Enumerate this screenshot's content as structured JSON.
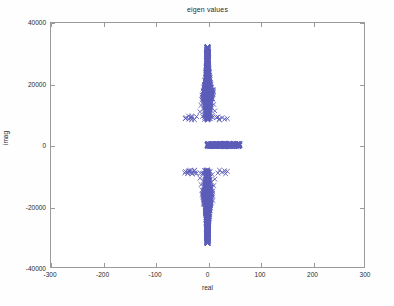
{
  "chart_data": {
    "type": "scatter",
    "title": "eigen values",
    "xlabel": "real",
    "ylabel": "imag",
    "xlim": [
      -300,
      300
    ],
    "ylim": [
      -40000,
      40000
    ],
    "xticks": [
      -300,
      -200,
      -100,
      0,
      100,
      200,
      300
    ],
    "yticks": [
      -40000,
      -20000,
      0,
      20000,
      40000
    ],
    "xticklabels": [
      "-300",
      "-200",
      "-100",
      "0",
      "100",
      "200",
      "300"
    ],
    "yticklabels": [
      "-40000",
      "-20000",
      "0",
      "20000",
      "40000"
    ],
    "grid": false,
    "legend": null,
    "marker": "x",
    "marker_color": "#5b5bb8",
    "axes_color": "#9a9a9a",
    "background_color": "#ffffff",
    "series": [
      {
        "name": "eigenvalues",
        "description": "Complex eigenvalue spectrum: two dense conjugate vertical plumes near real=0 spanning imag from about +/-8000 to +/-32500, plus a dense band of purely real eigenvalues from real=0 to about real=62 at imag=0, plus scattered outliers near imag=+/-9000 spread over real=-42 to +40.",
        "points": [
          [
            0.4,
            31800
          ],
          [
            -0.6,
            31100
          ],
          [
            1.1,
            30500
          ],
          [
            -1.4,
            29800
          ],
          [
            0.9,
            29200
          ],
          [
            -0.3,
            28600
          ],
          [
            1.8,
            28000
          ],
          [
            -1.9,
            27500
          ],
          [
            0.2,
            26900
          ],
          [
            2.3,
            26300
          ],
          [
            -2.5,
            25800
          ],
          [
            1.0,
            25200
          ],
          [
            -0.8,
            24700
          ],
          [
            3.1,
            24100
          ],
          [
            -3.0,
            23600
          ],
          [
            0.5,
            23000
          ],
          [
            2.2,
            22500
          ],
          [
            -2.8,
            21900
          ],
          [
            4.0,
            21400
          ],
          [
            -4.2,
            20800
          ],
          [
            1.3,
            20300
          ],
          [
            -1.1,
            19800
          ],
          [
            5.0,
            19300
          ],
          [
            -5.3,
            18800
          ],
          [
            0.7,
            18300
          ],
          [
            6.5,
            17900
          ],
          [
            -6.8,
            17500
          ],
          [
            2.0,
            17100
          ],
          [
            -2.2,
            16700
          ],
          [
            8.0,
            16300
          ],
          [
            -8.4,
            16000
          ],
          [
            3.5,
            15700
          ],
          [
            -3.7,
            15400
          ],
          [
            10.0,
            15100
          ],
          [
            -10.5,
            14800
          ],
          [
            1.5,
            14500
          ],
          [
            -1.7,
            14200
          ],
          [
            6.0,
            13900
          ],
          [
            -6.3,
            13600
          ],
          [
            12.0,
            13300
          ],
          [
            -12.4,
            13000
          ],
          [
            2.8,
            12700
          ],
          [
            -3.1,
            12400
          ],
          [
            7.5,
            12100
          ],
          [
            -7.9,
            11800
          ],
          [
            0.9,
            11500
          ],
          [
            14.0,
            11200
          ],
          [
            -14.5,
            10900
          ],
          [
            4.5,
            10600
          ],
          [
            -4.8,
            10300
          ],
          [
            1.2,
            10000
          ],
          [
            9.0,
            9700
          ],
          [
            -9.5,
            9400
          ],
          [
            -21.0,
            9300
          ],
          [
            20.0,
            9200
          ],
          [
            -30.0,
            9000
          ],
          [
            28.0,
            8950
          ],
          [
            -42.0,
            8700
          ],
          [
            38.0,
            8650
          ],
          [
            -36.0,
            8500
          ],
          [
            33.0,
            8450
          ],
          [
            -25.0,
            8300
          ],
          [
            23.0,
            8250
          ],
          [
            2.0,
            9000
          ],
          [
            -2.4,
            8800
          ],
          [
            5.5,
            8600
          ],
          [
            -5.9,
            8400
          ],
          [
            0.3,
            8200
          ],
          [
            0.0,
            0
          ],
          [
            3.0,
            0
          ],
          [
            6.0,
            0
          ],
          [
            9.0,
            0
          ],
          [
            12.0,
            0
          ],
          [
            15.0,
            0
          ],
          [
            18.0,
            0
          ],
          [
            21.0,
            0
          ],
          [
            24.0,
            0
          ],
          [
            27.0,
            0
          ],
          [
            30.0,
            0
          ],
          [
            33.0,
            0
          ],
          [
            36.0,
            0
          ],
          [
            39.0,
            0
          ],
          [
            42.0,
            0
          ],
          [
            45.0,
            0
          ],
          [
            48.0,
            0
          ],
          [
            51.0,
            0
          ],
          [
            54.0,
            0
          ],
          [
            57.0,
            0
          ],
          [
            60.0,
            0
          ],
          [
            62.0,
            0
          ],
          [
            -1.0,
            0
          ],
          [
            0.4,
            -31800
          ],
          [
            -0.6,
            -31100
          ],
          [
            1.1,
            -30500
          ],
          [
            -1.4,
            -29800
          ],
          [
            0.9,
            -29200
          ],
          [
            -0.3,
            -28600
          ],
          [
            1.8,
            -28000
          ],
          [
            -1.9,
            -27500
          ],
          [
            0.2,
            -26900
          ],
          [
            2.3,
            -26300
          ],
          [
            -2.5,
            -25800
          ],
          [
            1.0,
            -25200
          ],
          [
            -0.8,
            -24700
          ],
          [
            3.1,
            -24100
          ],
          [
            -3.0,
            -23600
          ],
          [
            0.5,
            -23000
          ],
          [
            2.2,
            -22500
          ],
          [
            -2.8,
            -21900
          ],
          [
            4.0,
            -21400
          ],
          [
            -4.2,
            -20800
          ],
          [
            1.3,
            -20300
          ],
          [
            -1.1,
            -19800
          ],
          [
            5.0,
            -19300
          ],
          [
            -5.3,
            -18800
          ],
          [
            0.7,
            -18300
          ],
          [
            6.5,
            -17900
          ],
          [
            -6.8,
            -17500
          ],
          [
            2.0,
            -17100
          ],
          [
            -2.2,
            -16700
          ],
          [
            8.0,
            -16300
          ],
          [
            -8.4,
            -16000
          ],
          [
            3.5,
            -15700
          ],
          [
            -3.7,
            -15400
          ],
          [
            10.0,
            -15100
          ],
          [
            -10.5,
            -14800
          ],
          [
            1.5,
            -14500
          ],
          [
            -1.7,
            -14200
          ],
          [
            6.0,
            -13900
          ],
          [
            -6.3,
            -13600
          ],
          [
            12.0,
            -13300
          ],
          [
            -12.4,
            -13000
          ],
          [
            2.8,
            -12700
          ],
          [
            -3.1,
            -12400
          ],
          [
            7.5,
            -12100
          ],
          [
            -7.9,
            -11800
          ],
          [
            0.9,
            -11500
          ],
          [
            14.0,
            -11200
          ],
          [
            -14.5,
            -10900
          ],
          [
            4.5,
            -10600
          ],
          [
            -4.8,
            -10300
          ],
          [
            1.2,
            -10000
          ],
          [
            9.0,
            -9700
          ],
          [
            -9.5,
            -9400
          ],
          [
            -21.0,
            -9300
          ],
          [
            20.0,
            -9200
          ],
          [
            -30.0,
            -9000
          ],
          [
            28.0,
            -8950
          ],
          [
            -42.0,
            -8700
          ],
          [
            38.0,
            -8650
          ],
          [
            -36.0,
            -8500
          ],
          [
            33.0,
            -8450
          ],
          [
            -25.0,
            -8300
          ],
          [
            23.0,
            -8250
          ],
          [
            2.0,
            -9000
          ],
          [
            -2.4,
            -8800
          ],
          [
            5.5,
            -8600
          ],
          [
            -5.9,
            -8400
          ],
          [
            0.3,
            -8200
          ]
        ]
      }
    ]
  }
}
